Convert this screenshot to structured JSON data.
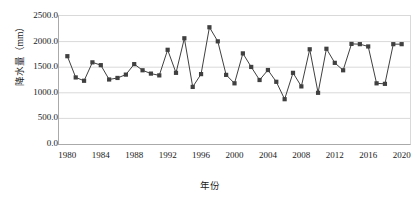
{
  "chart_data": {
    "type": "line",
    "title": "",
    "xlabel": "年份",
    "ylabel": "降水量（mm）",
    "xlim": [
      1979,
      2021
    ],
    "ylim": [
      0,
      2500
    ],
    "grid": true,
    "legend": false,
    "marker": "square",
    "series_color": "#404040",
    "line_color": "#404040",
    "gridline_color": "#d9d9d9",
    "x": [
      1980,
      1981,
      1982,
      1983,
      1984,
      1985,
      1986,
      1987,
      1988,
      1989,
      1990,
      1991,
      1992,
      1993,
      1994,
      1995,
      1996,
      1997,
      1998,
      1999,
      2000,
      2001,
      2002,
      2003,
      2004,
      2005,
      2006,
      2007,
      2008,
      2009,
      2010,
      2011,
      2012,
      2013,
      2014,
      2015,
      2016,
      2017,
      2018,
      2019,
      2020
    ],
    "values": [
      1715,
      1300,
      1235,
      1595,
      1540,
      1260,
      1290,
      1355,
      1560,
      1440,
      1375,
      1340,
      1840,
      1390,
      2065,
      1115,
      1365,
      2280,
      2005,
      1350,
      1185,
      1770,
      1505,
      1250,
      1445,
      1215,
      875,
      1390,
      1125,
      1850,
      1000,
      1860,
      1585,
      1440,
      1955,
      1950,
      1905,
      1185,
      1175,
      1950,
      1950
    ],
    "ytick_labels": [
      "0.0",
      "500.0",
      "1000.0",
      "1500.0",
      "2000.0",
      "2500.0"
    ],
    "ytick_values": [
      0,
      500,
      1000,
      1500,
      2000,
      2500
    ],
    "xtick_labels": [
      "1980",
      "1984",
      "1988",
      "1992",
      "1996",
      "2000",
      "2004",
      "2008",
      "2012",
      "2016",
      "2020"
    ],
    "xtick_values": [
      1980,
      1984,
      1988,
      1992,
      1996,
      2000,
      2004,
      2008,
      2012,
      2016,
      2020
    ]
  }
}
